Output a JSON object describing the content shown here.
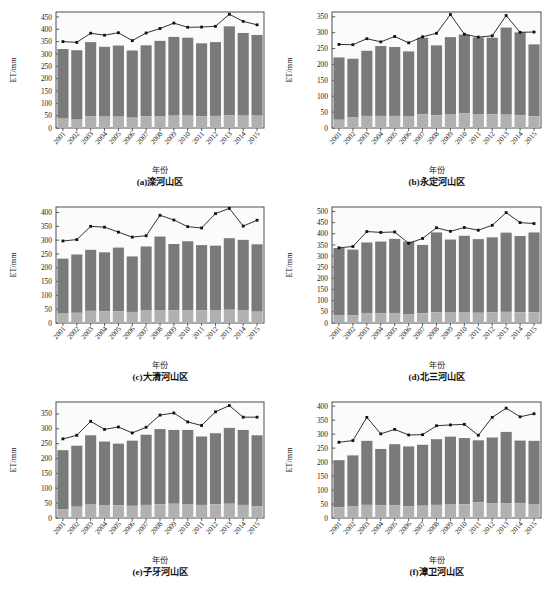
{
  "figure": {
    "width": 553,
    "height": 594,
    "background": "#ffffff",
    "panel_count": 6
  },
  "style": {
    "bar_upper_color": "#7a7a7a",
    "bar_lower_color": "#b0b0b0",
    "line_color": "#1c1c1c",
    "marker_color": "#101010",
    "frame_color": "#3a3a3a",
    "plot_bg": "#fbfbfb"
  },
  "common": {
    "xlabel": "年份",
    "ylabel": "ET/mm",
    "categories": [
      "2001",
      "2002",
      "2003",
      "2004",
      "2005",
      "2006",
      "2007",
      "2008",
      "2009",
      "2010",
      "2011",
      "2012",
      "2013",
      "2014",
      "2015"
    ]
  },
  "chart_data": [
    {
      "type": "bar",
      "panel": "a",
      "title": "(a)滦河山区",
      "xlabel": "年份",
      "ylabel": "ET/mm",
      "categories": [
        "2001",
        "2002",
        "2003",
        "2004",
        "2005",
        "2006",
        "2007",
        "2008",
        "2009",
        "2010",
        "2011",
        "2012",
        "2013",
        "2014",
        "2015"
      ],
      "ylim": [
        0,
        470
      ],
      "yticks": [
        0,
        50,
        100,
        150,
        200,
        250,
        300,
        350,
        400,
        450
      ],
      "grid": false,
      "legend": "none",
      "series": [
        {
          "name": "ET-lower-segment",
          "render": "bar-stack-bottom",
          "values": [
            38,
            34,
            48,
            46,
            46,
            42,
            47,
            48,
            50,
            50,
            47,
            49,
            52,
            50,
            50
          ]
        },
        {
          "name": "ET-upper-segment",
          "render": "bar-stack-top",
          "values": [
            282,
            281,
            300,
            283,
            288,
            272,
            288,
            305,
            319,
            316,
            296,
            299,
            360,
            335,
            327
          ]
        },
        {
          "name": "ET-total-line",
          "render": "line-marker",
          "values": [
            350,
            347,
            384,
            376,
            386,
            354,
            385,
            403,
            425,
            408,
            409,
            412,
            461,
            432,
            418
          ]
        }
      ],
      "bar_totals": [
        320,
        315,
        348,
        329,
        334,
        314,
        335,
        353,
        369,
        366,
        343,
        348,
        412,
        385,
        377
      ]
    },
    {
      "type": "bar",
      "panel": "b",
      "title": "(b)永定河山区",
      "xlabel": "年份",
      "ylabel": "ET/mm",
      "categories": [
        "2001",
        "2002",
        "2003",
        "2004",
        "2005",
        "2006",
        "2007",
        "2008",
        "2009",
        "2010",
        "2011",
        "2012",
        "2013",
        "2014",
        "2015"
      ],
      "ylim": [
        0,
        365
      ],
      "yticks": [
        0,
        50,
        100,
        150,
        200,
        250,
        300,
        350
      ],
      "grid": false,
      "legend": "none",
      "series": [
        {
          "name": "ET-lower-segment",
          "render": "bar-stack-bottom",
          "values": [
            26,
            33,
            38,
            38,
            38,
            36,
            43,
            40,
            44,
            46,
            44,
            43,
            42,
            40,
            37
          ]
        },
        {
          "name": "ET-upper-segment",
          "render": "bar-stack-top",
          "values": [
            196,
            185,
            205,
            220,
            217,
            205,
            241,
            220,
            242,
            248,
            241,
            241,
            274,
            261,
            226
          ]
        },
        {
          "name": "ET-total-line",
          "render": "line-marker",
          "values": [
            263,
            262,
            281,
            271,
            288,
            268,
            287,
            298,
            357,
            295,
            286,
            290,
            354,
            301,
            302
          ]
        }
      ],
      "bar_totals": [
        222,
        218,
        243,
        258,
        255,
        241,
        284,
        260,
        286,
        294,
        285,
        284,
        316,
        301,
        263
      ]
    },
    {
      "type": "bar",
      "panel": "c",
      "title": "(c)大清河山区",
      "xlabel": "年份",
      "ylabel": "ET/mm",
      "categories": [
        "2001",
        "2002",
        "2003",
        "2004",
        "2005",
        "2006",
        "2007",
        "2008",
        "2009",
        "2010",
        "2011",
        "2012",
        "2013",
        "2014",
        "2015"
      ],
      "ylim": [
        0,
        420
      ],
      "yticks": [
        0,
        50,
        100,
        150,
        200,
        250,
        300,
        350,
        400
      ],
      "grid": false,
      "legend": "none",
      "series": [
        {
          "name": "ET-lower-segment",
          "render": "bar-stack-bottom",
          "values": [
            34,
            37,
            44,
            42,
            43,
            40,
            45,
            47,
            46,
            47,
            46,
            47,
            48,
            45,
            41
          ]
        },
        {
          "name": "ET-upper-segment",
          "render": "bar-stack-top",
          "values": [
            199,
            211,
            221,
            214,
            230,
            201,
            232,
            266,
            240,
            249,
            236,
            233,
            259,
            256,
            244
          ]
        },
        {
          "name": "ET-total-line",
          "render": "line-marker",
          "values": [
            297,
            302,
            350,
            347,
            329,
            311,
            316,
            390,
            373,
            349,
            344,
            396,
            415,
            351,
            372
          ]
        }
      ],
      "bar_totals": [
        233,
        248,
        265,
        256,
        273,
        241,
        277,
        313,
        286,
        296,
        282,
        280,
        307,
        301,
        285
      ]
    },
    {
      "type": "bar",
      "panel": "d",
      "title": "(d)北三河山区",
      "xlabel": "年份",
      "ylabel": "ET/mm",
      "categories": [
        "2001",
        "2002",
        "2003",
        "2004",
        "2005",
        "2006",
        "2007",
        "2008",
        "2009",
        "2010",
        "2011",
        "2012",
        "2013",
        "2014",
        "2015"
      ],
      "ylim": [
        0,
        520
      ],
      "yticks": [
        0,
        50,
        100,
        150,
        200,
        250,
        300,
        350,
        400,
        450,
        500
      ],
      "grid": false,
      "legend": "none",
      "series": [
        {
          "name": "ET-lower-segment",
          "render": "bar-stack-bottom",
          "values": [
            36,
            34,
            45,
            44,
            45,
            38,
            43,
            48,
            47,
            49,
            46,
            48,
            50,
            48,
            48
          ]
        },
        {
          "name": "ET-upper-segment",
          "render": "bar-stack-top",
          "values": [
            300,
            295,
            316,
            321,
            332,
            327,
            307,
            358,
            327,
            342,
            330,
            336,
            355,
            342,
            358
          ]
        },
        {
          "name": "ET-total-line",
          "render": "line-marker",
          "values": [
            337,
            343,
            410,
            406,
            408,
            357,
            379,
            427,
            411,
            428,
            416,
            438,
            495,
            450,
            446
          ]
        }
      ],
      "bar_totals": [
        336,
        329,
        361,
        365,
        377,
        365,
        350,
        406,
        374,
        391,
        376,
        384,
        405,
        390,
        406
      ]
    },
    {
      "type": "bar",
      "panel": "e",
      "title": "(e)子牙河山区",
      "xlabel": "年份",
      "ylabel": "ET/mm",
      "categories": [
        "2001",
        "2002",
        "2003",
        "2004",
        "2005",
        "2006",
        "2007",
        "2008",
        "2009",
        "2010",
        "2011",
        "2012",
        "2013",
        "2014",
        "2015"
      ],
      "ylim": [
        0,
        390
      ],
      "yticks": [
        0,
        50,
        100,
        150,
        200,
        250,
        300,
        350
      ],
      "grid": false,
      "legend": "none",
      "series": [
        {
          "name": "ET-lower-segment",
          "render": "bar-stack-bottom",
          "values": [
            30,
            38,
            45,
            42,
            43,
            41,
            44,
            46,
            48,
            47,
            44,
            46,
            48,
            44,
            39
          ]
        },
        {
          "name": "ET-upper-segment",
          "render": "bar-stack-top",
          "values": [
            198,
            205,
            233,
            215,
            207,
            219,
            236,
            253,
            248,
            249,
            230,
            239,
            255,
            252,
            239
          ]
        },
        {
          "name": "ET-total-line",
          "render": "line-marker",
          "values": [
            266,
            278,
            325,
            298,
            306,
            286,
            305,
            346,
            353,
            323,
            311,
            357,
            378,
            339,
            339
          ]
        }
      ],
      "bar_totals": [
        228,
        243,
        278,
        257,
        250,
        260,
        280,
        299,
        296,
        296,
        274,
        285,
        303,
        296,
        278
      ]
    },
    {
      "type": "bar",
      "panel": "f",
      "title": "(f)漳卫河山区",
      "xlabel": "年份",
      "ylabel": "ET/mm",
      "categories": [
        "2001",
        "2002",
        "2003",
        "2004",
        "2005",
        "2006",
        "2007",
        "2008",
        "2009",
        "2010",
        "2011",
        "2012",
        "2013",
        "2014",
        "2015"
      ],
      "ylim": [
        0,
        415
      ],
      "yticks": [
        0,
        50,
        100,
        150,
        200,
        250,
        300,
        350,
        400
      ],
      "grid": false,
      "legend": "none",
      "series": [
        {
          "name": "ET-lower-segment",
          "render": "bar-stack-bottom",
          "values": [
            38,
            43,
            47,
            45,
            45,
            42,
            44,
            47,
            48,
            49,
            56,
            52,
            52,
            53,
            48
          ]
        },
        {
          "name": "ET-upper-segment",
          "render": "bar-stack-top",
          "values": [
            169,
            181,
            229,
            202,
            219,
            214,
            218,
            235,
            243,
            237,
            222,
            236,
            256,
            224,
            228
          ]
        },
        {
          "name": "ET-total-line",
          "render": "line-marker",
          "values": [
            271,
            277,
            360,
            301,
            317,
            297,
            298,
            330,
            333,
            335,
            296,
            360,
            393,
            362,
            373
          ]
        }
      ],
      "bar_totals": [
        207,
        224,
        276,
        247,
        264,
        256,
        262,
        282,
        291,
        286,
        278,
        288,
        308,
        277,
        276
      ]
    }
  ]
}
